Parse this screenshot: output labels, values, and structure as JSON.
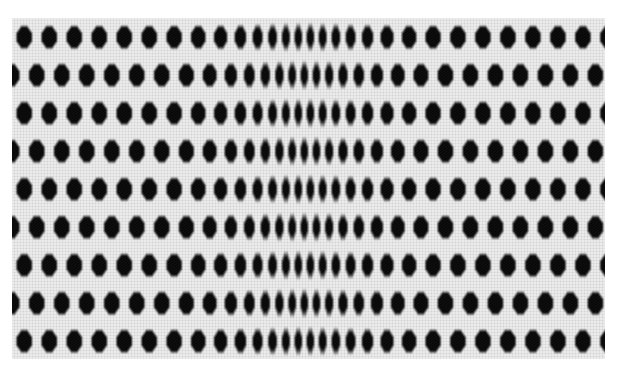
{
  "image": {
    "title": "Moire Interference Pattern",
    "alt_text": "Black and white moire pattern of staggered dark octagonal blobs on a fine woven mesh, horizontally compressed toward a vertical seam near the center",
    "width": 623,
    "height": 377,
    "background_color": "#ffffff"
  },
  "pattern": {
    "name": "moire-interference-weave",
    "kind": "halftone-moire",
    "region": {
      "left": 12,
      "top": 18,
      "width": 593,
      "height": 341
    },
    "colors": {
      "dark": "#060606",
      "dark_soft": "#1a1a1a",
      "mesh_light": "#f2f2f2",
      "mesh_mid": "#dcdcdc",
      "mesh_line": "#b4b4b4",
      "background": "#ffffff"
    },
    "geometry": {
      "vertical_period_px": 38,
      "row_stagger_fraction": 0.5,
      "edge_horizontal_period_px": 25,
      "center_horizontal_period_px": 12,
      "compression_center_x": 305,
      "compression_half_width_px": 150,
      "compression_strength": 0.55,
      "blob_shape": "rounded-octagon",
      "blob_fill_fraction_x": 0.62,
      "blob_fill_fraction_y": 0.58,
      "mesh_thread_pitch_px": 3,
      "mesh_thread_contrast": 0.28,
      "edge_softness_px": 1.6
    },
    "notes": "Left and right halves are near mirror images about the central seam; apparent cell width shrinks smoothly toward the seam producing the moire pinch."
  }
}
